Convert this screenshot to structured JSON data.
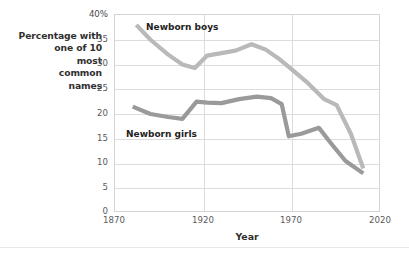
{
  "chart_data": {
    "type": "line",
    "title": "",
    "xlabel": "Year",
    "ylabel": "Percentage with one of 10 most common names",
    "ylabel_lines": [
      "Percentage with",
      "one of 10",
      "most",
      "common",
      "names"
    ],
    "xlim": [
      1870,
      2020
    ],
    "ylim": [
      0,
      40
    ],
    "xticks": [
      "1870",
      "1920",
      "1970",
      "2020"
    ],
    "xtick_values": [
      1870,
      1920,
      1970,
      2020
    ],
    "yticks": [
      "0",
      "5",
      "10",
      "15",
      "20",
      "25",
      "30",
      "35",
      "40%"
    ],
    "ytick_values": [
      0,
      5,
      10,
      15,
      20,
      25,
      30,
      35,
      40
    ],
    "grid": "horizontal-and-vertical",
    "legend_position": "inline-annotation",
    "series": [
      {
        "name": "Newborn boys",
        "color": "#b9b9b9",
        "label_x": 1910,
        "label_y": 38,
        "x": [
          1882,
          1890,
          1900,
          1908,
          1915,
          1922,
          1930,
          1938,
          1947,
          1955,
          1963,
          1968,
          1978,
          1988,
          1995,
          2003,
          2010
        ],
        "values": [
          38.0,
          35.0,
          32.0,
          30.0,
          29.3,
          31.8,
          32.3,
          32.8,
          34.1,
          33.0,
          31.0,
          29.5,
          26.5,
          23.0,
          21.8,
          16.0,
          9.0
        ]
      },
      {
        "name": "Newborn girls",
        "color": "#9a9a9a",
        "label_x": 1890,
        "label_y": 17,
        "x": [
          1880,
          1890,
          1900,
          1908,
          1916,
          1922,
          1930,
          1940,
          1950,
          1958,
          1964,
          1968,
          1975,
          1985,
          1992,
          2000,
          2010
        ],
        "values": [
          21.5,
          20.0,
          19.4,
          19.0,
          22.5,
          22.3,
          22.2,
          23.0,
          23.5,
          23.2,
          22.0,
          15.5,
          16.0,
          17.2,
          14.0,
          10.5,
          8.0
        ]
      }
    ]
  },
  "axes": {
    "y_title_lines": [
      "Percentage with",
      "one of 10",
      "most",
      "common",
      "names"
    ],
    "x_title": "Year",
    "y_tick_labels": [
      "40%",
      "35",
      "30",
      "25",
      "20",
      "15",
      "10",
      "5",
      "0"
    ],
    "x_tick_labels": [
      "1870",
      "1920",
      "1970",
      "2020"
    ]
  },
  "annotations": {
    "boys_label": "Newborn boys",
    "girls_label": "Newborn girls"
  },
  "colors": {
    "boys_line": "#b9b9b9",
    "girls_line": "#9a9a9a",
    "grid": "#dcdcdc",
    "frame": "#d4d4d4",
    "background": "#ffffff",
    "text": "#3b3b3b"
  }
}
